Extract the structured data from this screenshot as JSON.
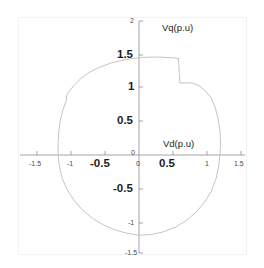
{
  "figure": {
    "background": "#ffffff",
    "frame_color": "#f2f2f2",
    "axis_color": "#9a9a9a",
    "curve_color": "#bdbdbd"
  },
  "chart_data": {
    "type": "line",
    "title": "",
    "subtitle": "",
    "xlabel": "Vd(p.u)",
    "ylabel": "Vq(p.u)",
    "xlim": [
      -1.5,
      1.5
    ],
    "ylim": [
      -1.5,
      2.0
    ],
    "grid": false,
    "legend": null,
    "legend_position": "none",
    "xticks": [
      -1.5,
      -1,
      -0.5,
      0,
      0.5,
      1,
      1.5
    ],
    "xticklabels": [
      "-1.5",
      "-1",
      "-0.5",
      "0",
      "0.5",
      "1",
      "1.5"
    ],
    "yticks": [
      -1.5,
      -1,
      -0.5,
      0,
      0.5,
      1,
      1.5,
      2
    ],
    "yticklabels": [
      "-1.5",
      "-1",
      "-0.5",
      "0",
      "0.5",
      "1",
      "1.5",
      "2"
    ],
    "series": [
      {
        "name": "voltage-limit-locus",
        "closed": true,
        "x": [
          0.58,
          0.5,
          0.4,
          0.3,
          0.18,
          0.05,
          -0.1,
          -0.26,
          -0.42,
          -0.58,
          -0.72,
          -0.85,
          -0.96,
          -1.04,
          -1.06,
          -1.07,
          -1.12,
          -1.16,
          -1.18,
          -1.19,
          -1.19,
          -1.17,
          -1.13,
          -1.06,
          -0.96,
          -0.84,
          -0.7,
          -0.54,
          -0.36,
          -0.18,
          0.0,
          0.18,
          0.36,
          0.54,
          0.7,
          0.84,
          0.96,
          1.06,
          1.13,
          1.17,
          1.19,
          1.2,
          1.19,
          1.16,
          1.12,
          1.06,
          0.98,
          0.88,
          0.78,
          0.68,
          0.6,
          0.58
        ],
        "y": [
          1.42,
          1.43,
          1.435,
          1.44,
          1.44,
          1.435,
          1.42,
          1.39,
          1.35,
          1.29,
          1.22,
          1.13,
          1.02,
          0.92,
          0.88,
          0.8,
          0.66,
          0.5,
          0.34,
          0.17,
          0.0,
          -0.17,
          -0.34,
          -0.5,
          -0.66,
          -0.8,
          -0.92,
          -1.02,
          -1.1,
          -1.15,
          -1.18,
          -1.17,
          -1.13,
          -1.06,
          -0.96,
          -0.84,
          -0.7,
          -0.54,
          -0.36,
          -0.18,
          0.0,
          0.18,
          0.36,
          0.54,
          0.7,
          0.84,
          0.94,
          1.02,
          1.06,
          1.06,
          1.06,
          1.42
        ]
      }
    ],
    "annotations": [
      {
        "text": "Vq(p.u)",
        "x": 0.34,
        "y": 1.8
      },
      {
        "text": "Vd(p.u)",
        "x": 0.36,
        "y": 0.17
      }
    ]
  },
  "axis_labels": {
    "vq": "Vq(p.u)",
    "vd": "Vd(p.u)"
  },
  "x_tick_labels": {
    "n15": "-1.5",
    "n1": "-1",
    "n05": "-0.5",
    "zero": "0",
    "p05": "0.5",
    "p1": "1",
    "p15": "1.5"
  },
  "y_tick_labels": {
    "p2": "2",
    "p15": "1.5",
    "p1": "1",
    "p05": "0.5",
    "zero": "0",
    "n05": "-0.5",
    "n1": "-1",
    "n15": "-1.5"
  }
}
